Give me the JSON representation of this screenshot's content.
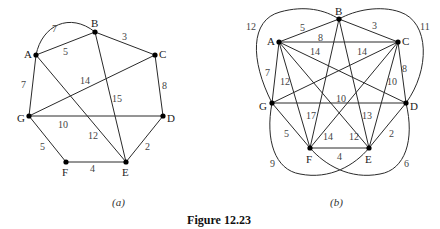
{
  "figure": {
    "caption": "Figure 12.23",
    "graph_a": {
      "sublabel": "(a)",
      "nodes": [
        {
          "id": "A",
          "x": 36,
          "y": 55,
          "lx": 24,
          "ly": 58
        },
        {
          "id": "B",
          "x": 95,
          "y": 32,
          "lx": 91,
          "ly": 27
        },
        {
          "id": "C",
          "x": 155,
          "y": 55,
          "lx": 159,
          "ly": 58
        },
        {
          "id": "D",
          "x": 163,
          "y": 116,
          "lx": 167,
          "ly": 122
        },
        {
          "id": "E",
          "x": 126,
          "y": 162,
          "lx": 122,
          "ly": 176
        },
        {
          "id": "F",
          "x": 66,
          "y": 162,
          "lx": 62,
          "ly": 176
        },
        {
          "id": "G",
          "x": 29,
          "y": 116,
          "lx": 17,
          "ly": 122
        }
      ],
      "edges": [
        {
          "from": "A",
          "to": "B",
          "w": "5",
          "wx": 63,
          "wy": 55
        },
        {
          "from": "A",
          "to": "B",
          "w": "7",
          "curve": true,
          "wx": 52,
          "wy": 32
        },
        {
          "from": "B",
          "to": "C",
          "w": "3",
          "wx": 122,
          "wy": 40
        },
        {
          "from": "C",
          "to": "D",
          "w": "8",
          "wx": 162,
          "wy": 89
        },
        {
          "from": "D",
          "to": "E",
          "w": "2",
          "wx": 145,
          "wy": 150
        },
        {
          "from": "E",
          "to": "F",
          "w": "4",
          "wx": 90,
          "wy": 172
        },
        {
          "from": "F",
          "to": "G",
          "w": "5",
          "wx": 40,
          "wy": 150
        },
        {
          "from": "G",
          "to": "A",
          "w": "7",
          "wx": 21,
          "wy": 88
        },
        {
          "from": "G",
          "to": "C",
          "w": "14",
          "wx": 80,
          "wy": 84
        },
        {
          "from": "G",
          "to": "D",
          "w": "10",
          "wx": 58,
          "wy": 128
        },
        {
          "from": "A",
          "to": "E",
          "w": "12",
          "wx": 88,
          "wy": 139
        },
        {
          "from": "B",
          "to": "E",
          "w": "15",
          "wx": 112,
          "wy": 102
        }
      ]
    },
    "graph_b": {
      "sublabel": "(b)",
      "nodes": [
        {
          "id": "A",
          "x": 279,
          "y": 42,
          "lx": 267,
          "ly": 45
        },
        {
          "id": "B",
          "x": 339,
          "y": 19,
          "lx": 335,
          "ly": 15
        },
        {
          "id": "C",
          "x": 398,
          "y": 42,
          "lx": 402,
          "ly": 45
        },
        {
          "id": "D",
          "x": 406,
          "y": 103,
          "lx": 410,
          "ly": 110
        },
        {
          "id": "E",
          "x": 369,
          "y": 148,
          "lx": 365,
          "ly": 163
        },
        {
          "id": "F",
          "x": 310,
          "y": 148,
          "lx": 306,
          "ly": 163
        },
        {
          "id": "G",
          "x": 272,
          "y": 103,
          "lx": 259,
          "ly": 110
        }
      ],
      "edges": [
        {
          "from": "A",
          "to": "B",
          "w": "5",
          "wx": 300,
          "wy": 31
        },
        {
          "from": "B",
          "to": "C",
          "w": "3",
          "wx": 372,
          "wy": 29
        },
        {
          "from": "A",
          "to": "C",
          "w": "8",
          "wx": 318,
          "wy": 41
        },
        {
          "from": "A",
          "to": "D",
          "w": "14",
          "wx": 310,
          "wy": 55
        },
        {
          "from": "C",
          "to": "G",
          "w": "14",
          "wx": 357,
          "wy": 55
        },
        {
          "from": "A",
          "to": "G",
          "w": "7",
          "wx": 265,
          "wy": 76
        },
        {
          "from": "A",
          "to": "F",
          "w": "12",
          "wx": 280,
          "wy": 85
        },
        {
          "from": "A",
          "to": "E",
          "w": "",
          "wx": 0,
          "wy": 0
        },
        {
          "from": "C",
          "to": "D",
          "w": "8",
          "wx": 402,
          "wy": 72
        },
        {
          "from": "C",
          "to": "E",
          "w": "10",
          "wx": 387,
          "wy": 85
        },
        {
          "from": "C",
          "to": "F",
          "w": "",
          "wx": 0,
          "wy": 0
        },
        {
          "from": "G",
          "to": "D",
          "w": "10",
          "wx": 336,
          "wy": 102
        },
        {
          "from": "B",
          "to": "F",
          "w": "17",
          "wx": 306,
          "wy": 119
        },
        {
          "from": "B",
          "to": "E",
          "w": "13",
          "wx": 362,
          "wy": 119
        },
        {
          "from": "G",
          "to": "F",
          "w": "5",
          "wx": 284,
          "wy": 137
        },
        {
          "from": "D",
          "to": "E",
          "w": "2",
          "wx": 389,
          "wy": 137
        },
        {
          "from": "F",
          "to": "E",
          "w": "4",
          "wx": 337,
          "wy": 160
        },
        {
          "from": "A",
          "to": "E",
          "w": "12",
          "wx": 349,
          "wy": 140,
          "label_only": true
        },
        {
          "from": "C",
          "to": "F",
          "w": "14",
          "wx": 323,
          "wy": 140,
          "label_only": true
        }
      ],
      "curves": [
        {
          "name": "G-B",
          "w": "12",
          "d": "M272,103 C250,60 250,20 280,12 C305,5 325,10 339,19",
          "wx": 246,
          "wy": 30
        },
        {
          "name": "B-D",
          "w": "11",
          "d": "M339,19 C355,10 380,5 400,12 C430,22 430,70 406,103",
          "wx": 420,
          "wy": 30
        },
        {
          "name": "G-E",
          "w": "9",
          "d": "M272,103 C265,140 275,170 300,174 C330,180 355,165 369,148",
          "wx": 270,
          "wy": 167
        },
        {
          "name": "F-D",
          "w": "6",
          "d": "M310,148 C325,165 350,180 380,174 C405,170 415,140 406,103",
          "wx": 404,
          "wy": 167
        }
      ]
    }
  },
  "colors": {
    "edge": "#2a2a2a",
    "node": "#000000",
    "background": "#ffffff"
  }
}
